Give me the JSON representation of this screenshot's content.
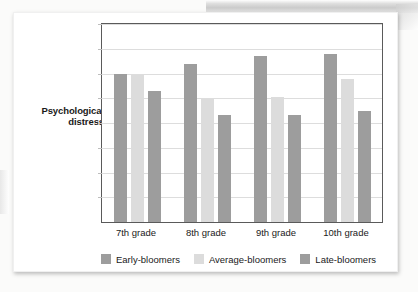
{
  "chart_data": {
    "type": "bar",
    "title": "",
    "xlabel": "",
    "ylabel": "Psychological distress",
    "ylabel_lines": [
      "Psychological",
      "distress"
    ],
    "categories": [
      "7th grade",
      "8th grade",
      "9th grade",
      "10th grade"
    ],
    "series": [
      {
        "name": "Early-bloomers",
        "color": "#9d9d9d",
        "values": [
          0.75,
          0.8,
          0.84,
          0.85
        ]
      },
      {
        "name": "Average-bloomers",
        "color": "#dcdcdc",
        "values": [
          0.74,
          0.62,
          0.63,
          0.72
        ]
      },
      {
        "name": "Late-bloomers",
        "color": "#9d9d9d",
        "values": [
          0.66,
          0.54,
          0.54,
          0.56
        ]
      }
    ],
    "ylim": [
      0,
      1
    ],
    "y_tick_values": [
      0,
      0.125,
      0.25,
      0.375,
      0.5,
      0.625,
      0.75,
      0.875,
      1
    ],
    "y_tick_labels": [
      "",
      "",
      "",
      "",
      "",
      "",
      "",
      "",
      ""
    ],
    "grid": true,
    "legend_position": "bottom"
  },
  "axis": {
    "y_title_line1": "Psychological",
    "y_title_line2": "distress"
  },
  "legend": {
    "items": [
      {
        "label": "Early-bloomers",
        "color": "#9d9d9d"
      },
      {
        "label": "Average-bloomers",
        "color": "#dcdcdc"
      },
      {
        "label": "Late-bloomers",
        "color": "#9d9d9d"
      }
    ]
  },
  "colors": {
    "bar_dark": "#9d9d9d",
    "bar_light": "#dcdcdc",
    "frame": "#5a5a5a",
    "gridline": "#dddddd",
    "text": "#1a1a1a",
    "card_background": "#ffffff"
  }
}
